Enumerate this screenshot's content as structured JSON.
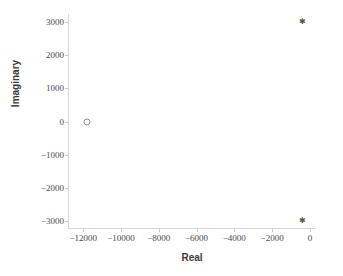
{
  "chart_data": {
    "type": "scatter",
    "title": "",
    "xlabel": "Real",
    "ylabel": "Imaginary",
    "xlim": [
      -12800,
      320
    ],
    "ylim": [
      -3250,
      3250
    ],
    "grid": false,
    "legend": null,
    "xticks": [
      -12000,
      -10000,
      -8000,
      -6000,
      -4000,
      -2000,
      0
    ],
    "xticklabels": [
      "−12000",
      "−10000",
      "−8000",
      "−6000",
      "−4000",
      "−2000",
      "0"
    ],
    "yticks": [
      3000,
      2000,
      1000,
      0,
      -1000,
      -2000,
      -3000
    ],
    "yticklabels": [
      "3000",
      "2000",
      "1000",
      "0",
      "−1000",
      "−2000",
      "−3000"
    ],
    "series": [
      {
        "name": "poles",
        "marker": "asterisk",
        "color": "#555555",
        "points": [
          {
            "x": -400,
            "y": 3000,
            "glyph": "✱"
          },
          {
            "x": -400,
            "y": -3000,
            "glyph": "✱"
          }
        ]
      },
      {
        "name": "real-pole",
        "marker": "circle-open",
        "color": "#8a8a8a",
        "points": [
          {
            "x": -11800,
            "y": 0,
            "glyph": ""
          }
        ]
      }
    ]
  },
  "axes": {
    "spine_color": "#d8d8d8",
    "tick_color": "#c9c9c9",
    "tick_label_color": "#4a4a4a",
    "axis_label_color": "#3a3a3a"
  },
  "figure": {
    "background": "#ffffff"
  }
}
